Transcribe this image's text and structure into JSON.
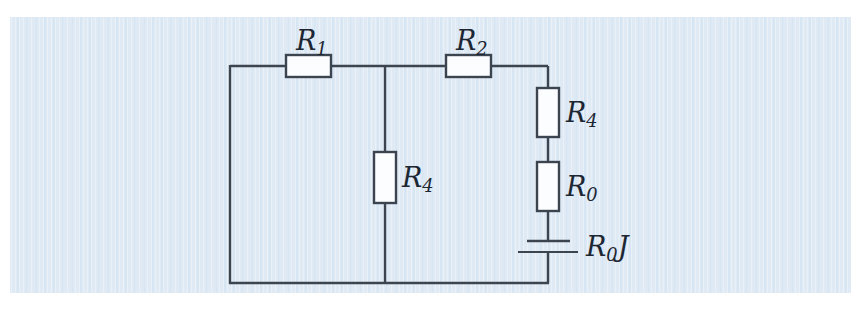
{
  "figure": {
    "type": "circuit-diagram",
    "background_color": "#dfeaf5",
    "line_color": "#3c4450",
    "component_fill": "#fbfdff"
  },
  "labels": {
    "r1": {
      "base": "R",
      "sub": "1",
      "text": "R1"
    },
    "r2": {
      "base": "R",
      "sub": "2",
      "text": "R2"
    },
    "r4_middle": {
      "base": "R",
      "sub": "4",
      "text": "R4"
    },
    "r4_right": {
      "base": "R",
      "sub": "4",
      "text": "R4"
    },
    "r0": {
      "base": "R",
      "sub": "0",
      "text": "R0"
    },
    "source": {
      "base": "R",
      "sub": "0",
      "suffix": "J",
      "text": "R0J"
    }
  },
  "components": [
    {
      "name": "resistor-r1",
      "orientation": "horizontal",
      "label": "R1"
    },
    {
      "name": "resistor-r2",
      "orientation": "horizontal",
      "label": "R2"
    },
    {
      "name": "resistor-r4-middle",
      "orientation": "vertical",
      "label": "R4"
    },
    {
      "name": "resistor-r4-right",
      "orientation": "vertical",
      "label": "R4"
    },
    {
      "name": "resistor-r0",
      "orientation": "vertical",
      "label": "R0"
    },
    {
      "name": "voltage-source",
      "orientation": "vertical",
      "label": "R0J"
    }
  ]
}
